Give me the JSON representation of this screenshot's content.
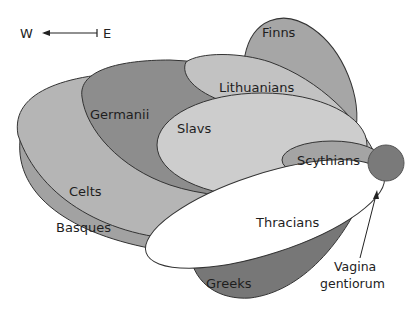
{
  "compass": {
    "west": "W",
    "east": "E"
  },
  "groups": [
    {
      "id": "basques",
      "label": "Basques",
      "color": "#a2a2a2"
    },
    {
      "id": "celts",
      "label": "Celts",
      "color": "#b5b5b5"
    },
    {
      "id": "greeks",
      "label": "Greeks",
      "color": "#777777"
    },
    {
      "id": "germanii",
      "label": "Germanii",
      "color": "#8d8d8d"
    },
    {
      "id": "finns",
      "label": "Finns",
      "color": "#a6a6a6"
    },
    {
      "id": "lithuanians",
      "label": "Lithuanians",
      "color": "#c2c2c2"
    },
    {
      "id": "slavs",
      "label": "Slavs",
      "color": "#cdcdcd"
    },
    {
      "id": "scythians",
      "label": "Scythians",
      "color": "#a4a4a4"
    },
    {
      "id": "thracians",
      "label": "Thracians",
      "color": "#ffffff"
    }
  ],
  "origin": {
    "label_line1": "Vagina",
    "label_line2": "gentiorum",
    "color": "#7a7a7a"
  }
}
